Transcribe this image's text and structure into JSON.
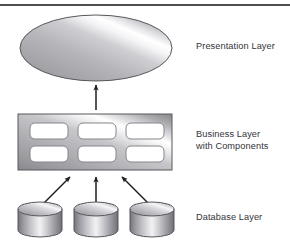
{
  "figure": {
    "background_color": "#ffffff",
    "rule_color": "#4d4d52",
    "text_color": "#333338",
    "metal_light": "#ffffff",
    "metal_mid": "#b9b9bd",
    "metal_dark": "#6f6f74",
    "outline_color": "#58585c",
    "component_fill": "#ffffff",
    "arrow_color": "#1d1d20"
  },
  "labels": {
    "presentation": "Presentation Layer",
    "business": "Business Layer\nwith Components",
    "database": "Database Layer"
  },
  "shapes": {
    "presentation_ellipse": {
      "cx": 96,
      "cy": 48,
      "rx": 76,
      "ry": 33
    },
    "business_rect": {
      "x": 18,
      "y": 114,
      "width": 154,
      "height": 56
    },
    "components": [
      {
        "id": "component-1",
        "x": 30,
        "y": 123,
        "width": 38,
        "height": 16
      },
      {
        "id": "component-2",
        "x": 78,
        "y": 123,
        "width": 38,
        "height": 16
      },
      {
        "id": "component-3",
        "x": 126,
        "y": 123,
        "width": 38,
        "height": 16
      },
      {
        "id": "component-4",
        "x": 30,
        "y": 146,
        "width": 38,
        "height": 16
      },
      {
        "id": "component-5",
        "x": 78,
        "y": 146,
        "width": 38,
        "height": 16
      },
      {
        "id": "component-6",
        "x": 126,
        "y": 146,
        "width": 38,
        "height": 16
      }
    ],
    "cylinders": [
      {
        "id": "database-cylinder-1",
        "x": 18,
        "y": 203,
        "width": 44,
        "height": 33
      },
      {
        "id": "database-cylinder-2",
        "x": 74,
        "y": 203,
        "width": 44,
        "height": 33
      },
      {
        "id": "database-cylinder-3",
        "x": 130,
        "y": 203,
        "width": 44,
        "height": 33
      }
    ],
    "arrows": [
      {
        "id": "arrow-business-to-presentation",
        "x1": 96,
        "y1": 110,
        "x2": 96,
        "y2": 84
      },
      {
        "id": "arrow-db1-to-business",
        "x1": 43,
        "y1": 202,
        "x2": 70,
        "y2": 176
      },
      {
        "id": "arrow-db2-to-business",
        "x1": 96,
        "y1": 202,
        "x2": 96,
        "y2": 176
      },
      {
        "id": "arrow-db3-to-business",
        "x1": 149,
        "y1": 202,
        "x2": 122,
        "y2": 176
      }
    ]
  }
}
